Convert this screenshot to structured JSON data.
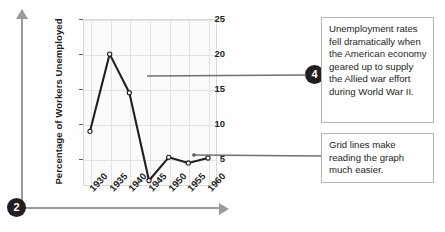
{
  "figure": {
    "badges": [
      {
        "name": "step-2",
        "label": "2"
      },
      {
        "name": "step-4",
        "label": "4"
      }
    ],
    "callouts": [
      {
        "id": "callout-1",
        "text": "Unemployment rates fell dramatically when the American economy geared up to supply the Allied war effort during World War II.",
        "badge": "4"
      },
      {
        "id": "callout-2",
        "text": "Grid lines make reading the graph much easier.",
        "badge": ""
      }
    ]
  },
  "chart_data": {
    "type": "line",
    "title": "",
    "xlabel": "",
    "ylabel": "Percentage of Workers Unemployed",
    "x": [
      "1930",
      "1935",
      "1940",
      "1945",
      "1950",
      "1955",
      "1960"
    ],
    "values": [
      9,
      20,
      14.5,
      2,
      5.3,
      4.5,
      5.2
    ],
    "series": [
      {
        "name": "Percentage of Workers Unemployed",
        "values": [
          9,
          20,
          14.5,
          2,
          5.3,
          4.5,
          5.2
        ]
      }
    ],
    "yticks": [
      25,
      20,
      15,
      10,
      5
    ],
    "ylim": [
      1.5,
      25
    ],
    "xlim": [
      "1930",
      "1960"
    ],
    "grid": true,
    "legend": "none",
    "marker": "open-circle",
    "line_color": "#231f20",
    "grid_color": "#e2e2e2",
    "plot_background": "#fbfbfb",
    "accent_color": "#231f20"
  },
  "axes": {
    "guide_arrow_color": "#9a9a9a",
    "vertical_arrow_name": "y-axis-guide-arrow",
    "horizontal_arrow_name": "x-axis-guide-arrow"
  }
}
